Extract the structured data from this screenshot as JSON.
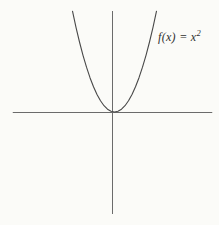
{
  "figure": {
    "label_base": "f(x) = x",
    "label_exponent": "2",
    "background": "#fbfbf8",
    "axis_color": "#6b6b6b",
    "curve_color": "#484848",
    "label_color": "#2f2f2f"
  },
  "chart_data": {
    "type": "line",
    "title": "",
    "xlabel": "",
    "ylabel": "",
    "annotation": "f(x) = x^2",
    "series": [
      {
        "name": "f(x) = x^2",
        "x": [
          -2.4,
          -2.2,
          -2.0,
          -1.8,
          -1.6,
          -1.4,
          -1.2,
          -1.0,
          -0.8,
          -0.6,
          -0.4,
          -0.2,
          0,
          0.2,
          0.4,
          0.6,
          0.8,
          1.0,
          1.2,
          1.4,
          1.6,
          1.8,
          2.0,
          2.2,
          2.4
        ],
        "y": [
          5.76,
          4.84,
          4.0,
          3.24,
          2.56,
          1.96,
          1.44,
          1.0,
          0.64,
          0.36,
          0.16,
          0.04,
          0,
          0.04,
          0.16,
          0.36,
          0.64,
          1.0,
          1.44,
          1.96,
          2.56,
          3.24,
          4.0,
          4.84,
          5.76
        ]
      }
    ],
    "xlim": [
      -5.7,
      5.7
    ],
    "ylim": [
      -5.8,
      5.8
    ],
    "grid": false,
    "legend": "none",
    "tick_labels": "none",
    "axes_style": "centered-cross"
  }
}
